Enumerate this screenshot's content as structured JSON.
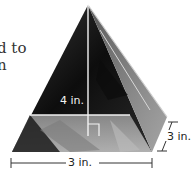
{
  "figure": {
    "type": "pyramid-photo-with-dimensions",
    "clipped_text": [
      "d to",
      "n"
    ],
    "labels": {
      "height": "4 in.",
      "base_width": "3 in.",
      "base_depth": "3 in."
    },
    "colors": {
      "background": "#ffffff",
      "glass_dark": "#111111",
      "glass_mid": "#6e6e6e",
      "glass_light": "#bdbdbd",
      "guide_line": "#f0f0f0",
      "dimension_line": "#333333"
    }
  }
}
